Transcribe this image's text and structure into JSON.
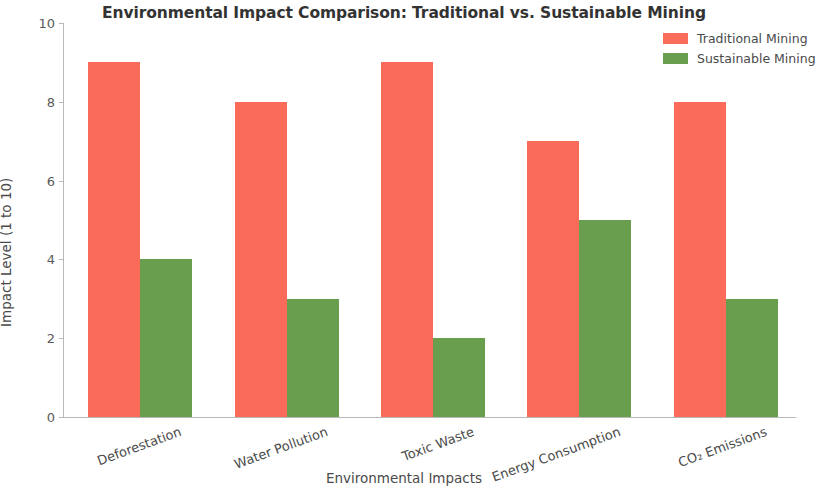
{
  "chart_data": {
    "type": "bar",
    "title": "Environmental Impact Comparison: Traditional vs. Sustainable Mining",
    "xlabel": "Environmental Impacts",
    "ylabel": "Impact Level (1 to 10)",
    "categories": [
      "Deforestation",
      "Water Pollution",
      "Toxic Waste",
      "Energy Consumption",
      "CO₂ Emissions"
    ],
    "series": [
      {
        "name": "Traditional Mining",
        "color": "#fa6b5a",
        "values": [
          9,
          8,
          9,
          7,
          8
        ]
      },
      {
        "name": "Sustainable Mining",
        "color": "#6a9e4f",
        "values": [
          4,
          3,
          2,
          5,
          3
        ]
      }
    ],
    "ylim": [
      0,
      10
    ],
    "yticks": [
      0,
      2,
      4,
      6,
      8,
      10
    ],
    "ytick_labels": [
      "0",
      "2",
      "4",
      "6",
      "8",
      "10"
    ],
    "grid": false,
    "legend_position": "upper right",
    "xtick_rotation": -20
  }
}
